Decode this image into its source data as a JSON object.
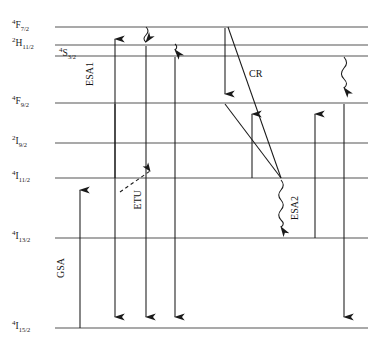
{
  "figure": {
    "type": "energy-level-diagram",
    "title": "",
    "width": 385,
    "height": 360,
    "background": "#ffffff",
    "line_color": "#555555",
    "arrow_color": "#1a1a1a"
  },
  "levels": [
    {
      "id": "F72",
      "term": "4F7/2",
      "sup": "4",
      "main": "F",
      "sub": "7/2",
      "y": 27,
      "x_start": 55,
      "x_end": 368,
      "label_x": 12,
      "label_y": 20
    },
    {
      "id": "H112",
      "term": "2H11/2",
      "sup": "2",
      "main": "H",
      "sub": "11/2",
      "y": 45,
      "x_start": 55,
      "x_end": 368,
      "label_x": 12,
      "label_y": 38
    },
    {
      "id": "S32",
      "term": "4S3/2",
      "sup": "4",
      "main": "S",
      "sub": "3/2",
      "y": 56,
      "x_start": 55,
      "x_end": 368,
      "label_x": 59,
      "label_y": 48
    },
    {
      "id": "F92",
      "term": "4F9/2",
      "sup": "4",
      "main": "F",
      "sub": "9/2",
      "y": 103,
      "x_start": 55,
      "x_end": 368,
      "label_x": 12,
      "label_y": 96
    },
    {
      "id": "I92",
      "term": "2I9/2",
      "sup": "2",
      "main": "I",
      "sub": "9/2",
      "y": 143,
      "x_start": 55,
      "x_end": 368,
      "label_x": 12,
      "label_y": 136
    },
    {
      "id": "I112",
      "term": "4I11/2",
      "sup": "4",
      "main": "I",
      "sub": "11/2",
      "y": 178,
      "x_start": 55,
      "x_end": 368,
      "label_x": 12,
      "label_y": 171
    },
    {
      "id": "I132",
      "term": "4I13/2",
      "sup": "4",
      "main": "I",
      "sub": "13/2",
      "y": 238,
      "x_start": 55,
      "x_end": 368,
      "label_x": 12,
      "label_y": 231
    },
    {
      "id": "I152",
      "term": "4I15/2",
      "sup": "4",
      "main": "I",
      "sub": "15/2",
      "y": 328,
      "x_start": 55,
      "x_end": 368,
      "label_x": 12,
      "label_y": 321
    }
  ],
  "process_labels": [
    {
      "id": "gsa",
      "text": "GSA",
      "x": 61,
      "y": 258,
      "orient": "vertical"
    },
    {
      "id": "esa1",
      "text": "ESA1",
      "x": 90,
      "y": 62,
      "orient": "vertical"
    },
    {
      "id": "etu",
      "text": "ETU",
      "x": 138,
      "y": 190,
      "orient": "vertical"
    },
    {
      "id": "cr",
      "text": "CR",
      "x": 249,
      "y": 68,
      "orient": "horizontal"
    },
    {
      "id": "esa2",
      "text": "ESA2",
      "x": 295,
      "y": 196,
      "orient": "vertical"
    }
  ],
  "transitions": [
    {
      "id": "gsa-arrow",
      "kind": "solid-up",
      "x": 80,
      "y_from": 328,
      "y_to": 180,
      "label": "GSA"
    },
    {
      "id": "esa1-arrow",
      "kind": "solid-up",
      "x": 115,
      "y_from": 178,
      "y_to": 29,
      "label": "ESA1"
    },
    {
      "id": "emission-1",
      "kind": "solid-down",
      "x": 115,
      "y_from": 104,
      "y_to": 326,
      "label": ""
    },
    {
      "id": "nonrad-top-1",
      "kind": "wavy-down",
      "x": 146,
      "y_from": 27,
      "y_to": 45,
      "label": ""
    },
    {
      "id": "emission-2",
      "kind": "solid-down",
      "x": 146,
      "y_from": 46,
      "y_to": 326,
      "label": ""
    },
    {
      "id": "nonrad-top-2",
      "kind": "wavy-down",
      "x": 175,
      "y_from": 45,
      "y_to": 57,
      "label": ""
    },
    {
      "id": "emission-3",
      "kind": "solid-down",
      "x": 175,
      "y_from": 57,
      "y_to": 326,
      "label": ""
    },
    {
      "id": "cr-down-arrow",
      "kind": "solid-down",
      "x": 225,
      "y_from": 28,
      "y_to": 101,
      "label": ""
    },
    {
      "id": "cr-diagonal-1",
      "kind": "diagonal",
      "x_from": 228,
      "y_from": 27,
      "x_to": 281,
      "y_to": 177,
      "label": "CR"
    },
    {
      "id": "cr-diagonal-2",
      "kind": "diagonal",
      "x_from": 225,
      "y_from": 103,
      "x_to": 281,
      "y_to": 178,
      "label": ""
    },
    {
      "id": "cr-up-arrow",
      "kind": "solid-up",
      "x": 252,
      "y_from": 178,
      "y_to": 105,
      "label": ""
    },
    {
      "id": "esa2-wavy",
      "kind": "wavy-down",
      "x": 281,
      "y_from": 180,
      "y_to": 236,
      "label": "ESA2"
    },
    {
      "id": "esa2-arrow",
      "kind": "solid-up",
      "x": 315,
      "y_from": 238,
      "y_to": 105,
      "label": ""
    },
    {
      "id": "nonrad-right",
      "kind": "wavy-down",
      "x": 344,
      "y_from": 57,
      "y_to": 101,
      "label": ""
    },
    {
      "id": "emission-4",
      "kind": "solid-down",
      "x": 344,
      "y_from": 104,
      "y_to": 326,
      "label": ""
    },
    {
      "id": "etu-dashed",
      "kind": "dashed-diag",
      "x_from": 120,
      "y_from": 190,
      "x_to": 152,
      "y_to": 168,
      "label": "ETU"
    }
  ]
}
